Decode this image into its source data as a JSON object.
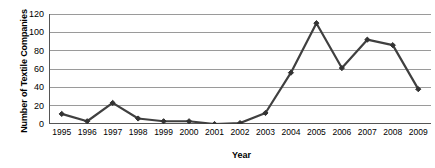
{
  "chart_data": {
    "type": "line",
    "title": "",
    "xlabel": "Year",
    "ylabel": "Number of Textile Companies",
    "categories": [
      "1995",
      "1996",
      "1997",
      "1998",
      "1999",
      "2000",
      "2001",
      "2002",
      "2003",
      "2004",
      "2005",
      "2006",
      "2007",
      "2008",
      "2009"
    ],
    "values": [
      11,
      3,
      23,
      6,
      3,
      3,
      0,
      1,
      12,
      56,
      110,
      61,
      92,
      86,
      38
    ],
    "series": [
      {
        "name": "Number of Textile Companies",
        "values": [
          11,
          3,
          23,
          6,
          3,
          3,
          0,
          1,
          12,
          56,
          110,
          61,
          92,
          86,
          38
        ]
      }
    ],
    "ylim": [
      0,
      120
    ],
    "yticks": [
      0,
      20,
      40,
      60,
      80,
      100,
      120
    ],
    "ytick_labels": [
      "0",
      "20",
      "40",
      "60",
      "80",
      "100",
      "120"
    ],
    "grid": "horizontal",
    "legend": "none",
    "marker": "diamond",
    "colors": {
      "line": "#404040",
      "marker": "#333333",
      "grid": "#9a9a9a",
      "axis": "#555555",
      "text": "#000000",
      "background": "#ffffff"
    }
  }
}
